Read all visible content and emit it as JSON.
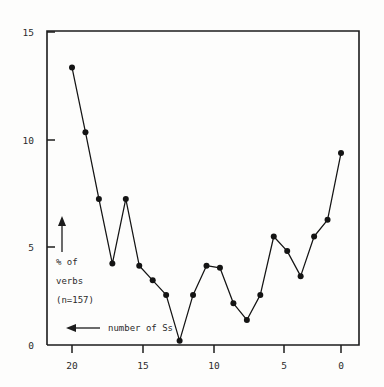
{
  "chart_data": {
    "type": "line",
    "title": "",
    "subtitle": "",
    "xlabel": "number of Ss",
    "ylabel": "% of verbs (n=157)",
    "xlim": [
      21,
      -1
    ],
    "ylim": [
      0,
      15
    ],
    "x_ticks": [
      "20",
      "15",
      "10",
      "5",
      "0"
    ],
    "x_tick_values": [
      20,
      15,
      10,
      5,
      0
    ],
    "y_ticks": [
      "15",
      "10",
      "5",
      "0"
    ],
    "y_tick_values": [
      15,
      10,
      5,
      0
    ],
    "x_axis_direction": "descending",
    "grid": false,
    "legend": false,
    "marker": "filled-circle",
    "x": [
      20,
      19,
      18,
      17,
      16,
      15,
      14,
      13,
      12,
      11,
      10,
      9,
      8,
      7,
      6,
      5,
      4,
      3,
      2,
      1,
      0
    ],
    "values": [
      13.3,
      10.2,
      7.0,
      3.9,
      7.0,
      3.8,
      3.1,
      2.4,
      0.2,
      2.4,
      3.8,
      3.7,
      2.0,
      1.2,
      2.4,
      5.2,
      4.5,
      3.3,
      5.2,
      6.0,
      9.2
    ],
    "series": [
      {
        "name": "% of verbs",
        "values": [
          13.3,
          10.2,
          7.0,
          3.9,
          7.0,
          3.8,
          3.1,
          2.4,
          0.2,
          2.4,
          3.8,
          3.7,
          2.0,
          1.2,
          2.4,
          5.2,
          4.5,
          3.3,
          5.2,
          6.0,
          9.2
        ]
      }
    ],
    "annotations": [
      {
        "id": "y-axis-label",
        "text_lines": [
          "% of",
          "verbs",
          "(n=157)"
        ],
        "arrow": "up"
      },
      {
        "id": "x-axis-label",
        "text_lines": [
          "number of Ss"
        ],
        "arrow": "left"
      }
    ]
  },
  "labels": {
    "y_axis_line1": "% of",
    "y_axis_line2": "verbs",
    "y_axis_line3": "(n=157)",
    "x_axis_caption": "number of Ss",
    "y_tick_15": "15",
    "y_tick_10": "10",
    "y_tick_5": "5",
    "y_tick_0": "0",
    "x_tick_20": "20",
    "x_tick_15": "15",
    "x_tick_10": "10",
    "x_tick_5": "5",
    "x_tick_0": "0"
  },
  "colors": {
    "line": "#141414",
    "marker": "#141414",
    "axis": "#1c1c1c",
    "text": "#2b2b2b",
    "background": "#fdfdfc"
  }
}
